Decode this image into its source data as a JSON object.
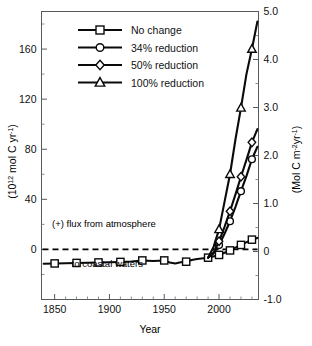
{
  "figure": {
    "background": "#ffffff",
    "line_color": "#0a0a0a",
    "axis_color": "#555a5e",
    "marker_fill": "#ffffff"
  },
  "chart_data": {
    "type": "line",
    "title": "",
    "xlabel": "Year",
    "ylabel": "(10^12 mol C yr^-1)",
    "ylabel_parts": {
      "pre": "(10",
      "sup": "12",
      "post": " mol C yr",
      "sup2": "-1",
      "close": ")"
    },
    "ylabel_right": "(Mol C m^-2 yr^-1)",
    "ylabel_right_parts": {
      "pre": "(Mol C m",
      "sup": "-2",
      "mid": "yr",
      "sup2": "-1",
      "close": ")"
    },
    "xlim": [
      1838,
      2036
    ],
    "ylim": [
      -40,
      190
    ],
    "ylim_right": [
      -1.0,
      5.0
    ],
    "grid": false,
    "xticks": [
      1850,
      1900,
      1950,
      2000
    ],
    "xtick_labels": [
      "1850",
      "1900",
      "1950",
      "2000"
    ],
    "xticks_minor": [
      1860,
      1870,
      1880,
      1890,
      1910,
      1920,
      1930,
      1940,
      1960,
      1970,
      1980,
      1990,
      2010,
      2020,
      2030
    ],
    "yticks": [
      0,
      40,
      80,
      120,
      160
    ],
    "ytick_labels": [
      "0",
      "40",
      "80",
      "120",
      "160"
    ],
    "yticks_minor": [
      -20,
      20,
      60,
      100,
      140,
      180
    ],
    "yticks_right": [
      -1.0,
      0,
      1.0,
      2.0,
      3.0,
      4.0,
      5.0
    ],
    "ytick_labels_right": [
      "-1.0",
      "0",
      "1.0",
      "2.0",
      "3.0",
      "4.0",
      "5.0"
    ],
    "yticks_right_minor": [
      -0.5,
      0.5,
      1.5,
      2.5,
      3.5,
      4.5
    ],
    "zero_reference_line": 0,
    "legend_position": "upper-left-inside",
    "series": [
      {
        "name": "No change",
        "marker": "square",
        "x": [
          1840,
          1850,
          1860,
          1870,
          1880,
          1890,
          1900,
          1910,
          1920,
          1930,
          1940,
          1950,
          1955,
          1960,
          1965,
          1970,
          1975,
          1980,
          1990,
          2000,
          2010,
          2020,
          2030,
          2035
        ],
        "y": [
          -11.5,
          -11.2,
          -11.0,
          -10.8,
          -10.6,
          -10.4,
          -10.2,
          -10.0,
          -9.6,
          -8.8,
          -9.3,
          -8.8,
          -10.4,
          -11.2,
          -10.2,
          -9.8,
          -8.4,
          -7.6,
          -6.6,
          -4.4,
          -0.8,
          3.6,
          7.8,
          9.2
        ],
        "marker_x": [
          1850,
          1870,
          1890,
          1910,
          1930,
          1950,
          1970,
          1990,
          2000,
          2010,
          2020,
          2030
        ],
        "marker_y": [
          -11.2,
          -10.8,
          -10.4,
          -10.0,
          -8.8,
          -8.8,
          -9.8,
          -6.6,
          -4.4,
          -0.8,
          3.6,
          7.8
        ]
      },
      {
        "name": "34% reduction",
        "marker": "circle",
        "x": [
          1990,
          1995,
          2000,
          2005,
          2010,
          2015,
          2020,
          2025,
          2030,
          2035
        ],
        "y": [
          -6.6,
          -3.2,
          3.5,
          12.5,
          22.5,
          34.0,
          46.5,
          58.5,
          72.0,
          82.0
        ],
        "marker_x": [
          2000,
          2010,
          2020,
          2030
        ],
        "marker_y": [
          3.5,
          22.5,
          46.5,
          72.0
        ]
      },
      {
        "name": "50% reduction",
        "marker": "diamond",
        "x": [
          1990,
          1995,
          2000,
          2005,
          2010,
          2015,
          2020,
          2025,
          2030,
          2035
        ],
        "y": [
          -6.6,
          -2.4,
          6.5,
          18.0,
          30.5,
          44.0,
          58.0,
          71.5,
          85.5,
          96.0
        ],
        "marker_x": [
          2000,
          2010,
          2020,
          2030
        ],
        "marker_y": [
          6.5,
          30.5,
          58.0,
          85.5
        ]
      },
      {
        "name": "100% reduction",
        "marker": "triangle",
        "x": [
          1990,
          1995,
          2000,
          2005,
          2010,
          2015,
          2020,
          2025,
          2030,
          2035
        ],
        "y": [
          -6.6,
          2.0,
          16.0,
          38.0,
          60.0,
          88.0,
          113.0,
          140.0,
          160.0,
          182.0
        ],
        "marker_x": [
          2000,
          2010,
          2020,
          2030
        ],
        "marker_y": [
          16.0,
          60.0,
          113.0,
          160.0
        ]
      }
    ],
    "annotations": [
      {
        "text": "(+) flux from atmosphere",
        "x": 1895,
        "y": 18,
        "anchor": "middle"
      },
      {
        "text": "to coastal waters",
        "x": 1898,
        "y": -14,
        "anchor": "middle"
      }
    ]
  },
  "legend": {
    "items": [
      {
        "label": "No change",
        "marker": "square"
      },
      {
        "label": "34% reduction",
        "marker": "circle"
      },
      {
        "label": "50% reduction",
        "marker": "diamond"
      },
      {
        "label": "100% reduction",
        "marker": "triangle"
      }
    ]
  }
}
